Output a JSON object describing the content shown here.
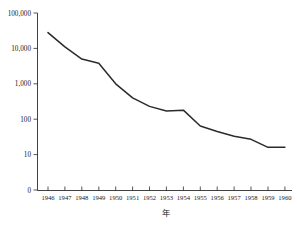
{
  "chart_data": {
    "type": "line",
    "title": "",
    "subtitle": "",
    "xlabel": "年",
    "ylabel": "",
    "yscale": "log",
    "grid": false,
    "legend": null,
    "legend_position": "none",
    "line_color": "#2b2b2b",
    "background_color": "#ffffff",
    "axis_color": "#2b2b2b",
    "x": [
      1946,
      1947,
      1948,
      1949,
      1950,
      1951,
      1952,
      1953,
      1954,
      1955,
      1956,
      1957,
      1958,
      1959,
      1960
    ],
    "categories": [
      "1946",
      "1947",
      "1948",
      "1949",
      "1950",
      "1951",
      "1952",
      "1953",
      "1954",
      "1955",
      "1956",
      "1957",
      "1958",
      "1959",
      "1960"
    ],
    "values": [
      28000,
      11000,
      5000,
      3800,
      1000,
      400,
      230,
      170,
      180,
      64,
      45,
      33,
      27,
      16,
      16
    ],
    "series": [
      {
        "name": "",
        "values": [
          28000,
          11000,
          5000,
          3800,
          1000,
          400,
          230,
          170,
          180,
          64,
          45,
          33,
          27,
          16,
          16
        ]
      }
    ],
    "x_tick_labels": [
      "1946",
      "1947",
      "1948",
      "1949",
      "1950",
      "1951",
      "1952",
      "1953",
      "1954",
      "1955",
      "1956",
      "1957",
      "1958",
      "1959",
      "1960"
    ],
    "y_tick_labels": [
      "100,000",
      "10,000",
      "1,000",
      "100",
      "10",
      "0"
    ],
    "y_tick_values": [
      100000,
      10000,
      1000,
      100,
      10,
      0
    ],
    "xlim": [
      1945.5,
      1960.5
    ],
    "ylim": [
      0,
      100000
    ]
  },
  "axis": {
    "x_title": "年"
  }
}
